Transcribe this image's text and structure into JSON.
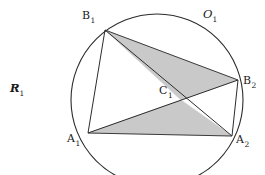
{
  "figure": {
    "background_color": "#ffffff",
    "stroke_color": "#2b2b2b",
    "shade_color": "#c9c9c9",
    "shade_stroke_color": "#555555"
  },
  "circle": {
    "name": "circumscribed-circle",
    "center_x": 157,
    "center_y": 100,
    "radius": 86,
    "label": "O",
    "label_sub": "1",
    "label_x": 203,
    "label_y": 9
  },
  "radius_annotation": {
    "label": "R",
    "label_sub": "1",
    "label_x": 10,
    "label_y": 83
  },
  "points": [
    {
      "id": "B1",
      "label": "B",
      "sub": "1",
      "x": 105,
      "y": 30,
      "label_x": 82,
      "label_y": 10
    },
    {
      "id": "B2",
      "label": "B",
      "sub": "2",
      "x": 238,
      "y": 80,
      "label_x": 243,
      "label_y": 75
    },
    {
      "id": "A1",
      "label": "A",
      "sub": "1",
      "x": 88,
      "y": 133,
      "label_x": 67,
      "label_y": 133
    },
    {
      "id": "A2",
      "label": "A",
      "sub": "2",
      "x": 232,
      "y": 136,
      "label_x": 236,
      "label_y": 134
    },
    {
      "id": "C1",
      "label": "C",
      "sub": "1",
      "x": 181,
      "y": 100,
      "label_x": 159,
      "label_y": 85
    }
  ],
  "segments": [
    {
      "name": "chord-B1-A1",
      "from": "B1",
      "to": "A1"
    },
    {
      "name": "chord-B1-B2",
      "from": "B1",
      "to": "B2"
    },
    {
      "name": "chord-B1-A2",
      "from": "B1",
      "to": "A2"
    },
    {
      "name": "chord-A1-B2",
      "from": "A1",
      "to": "B2"
    },
    {
      "name": "chord-A1-A2",
      "from": "A1",
      "to": "A2"
    },
    {
      "name": "chord-B2-A2",
      "from": "B2",
      "to": "A2"
    }
  ],
  "shaded_triangles": [
    {
      "name": "upper-shaded-triangle",
      "vertices": [
        "B1",
        "B2",
        "C1"
      ]
    },
    {
      "name": "lower-shaded-triangle",
      "vertices": [
        "A1",
        "C1",
        "A2"
      ]
    }
  ]
}
